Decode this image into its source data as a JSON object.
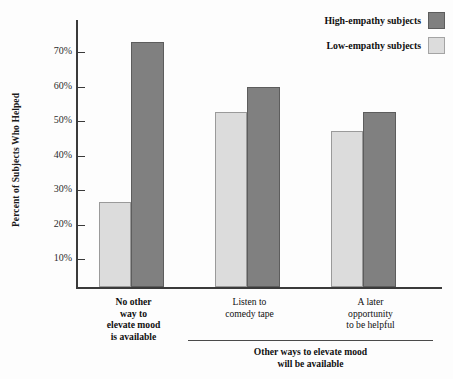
{
  "chart_data": {
    "type": "bar",
    "title": "",
    "xlabel": "",
    "ylabel": "Percent of Subjects Who Helped",
    "ylim": [
      0,
      80
    ],
    "grid": false,
    "legend_position": "top-right",
    "ytick_labels": [
      "70%",
      "60%",
      "50%",
      "40%",
      "30%",
      "20%",
      "10%"
    ],
    "ytick_values": [
      70,
      60,
      50,
      40,
      30,
      20,
      10
    ],
    "categories": [
      "No other way to elevate mood is available",
      "Listen to comedy tape",
      "A later opportunity to be helpful"
    ],
    "series": [
      {
        "name": "Low-empathy subjects",
        "color": "#dcdcdc",
        "values": [
          26.5,
          52.5,
          47.0
        ]
      },
      {
        "name": "High-empathy subjects",
        "color": "#808080",
        "values": [
          73.0,
          60.0,
          52.5
        ]
      }
    ],
    "annotations": [
      "Other ways to elevate mood will be available"
    ]
  },
  "axis": {
    "y_title": "Percent of Subjects Who Helped",
    "ticks": [
      {
        "label": "70%",
        "value": 70
      },
      {
        "label": "60%",
        "value": 60
      },
      {
        "label": "50%",
        "value": 50
      },
      {
        "label": "40%",
        "value": 40
      },
      {
        "label": "30%",
        "value": 30
      },
      {
        "label": "20%",
        "value": 20
      },
      {
        "label": "10%",
        "value": 10
      }
    ]
  },
  "legend": {
    "high_label": "High-empathy subjects",
    "low_label": "Low-empathy subjects",
    "high_color": "#808080",
    "low_color": "#dcdcdc"
  },
  "groups": [
    {
      "id": "no-other-way",
      "line1": "No other",
      "line2": "way to",
      "line3": "elevate mood",
      "line4": "is available"
    },
    {
      "id": "comedy-tape",
      "line1": "Listen to",
      "line2": "comedy tape",
      "line3": "",
      "line4": ""
    },
    {
      "id": "later-opportunity",
      "line1": "A later",
      "line2": "opportunity",
      "line3": "to be helpful",
      "line4": ""
    }
  ],
  "bracket": {
    "line1": "Other ways to elevate mood",
    "line2": "will be available"
  }
}
